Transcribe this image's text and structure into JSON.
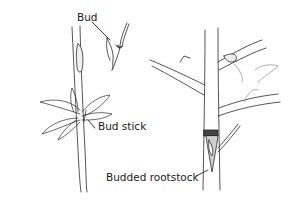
{
  "diagram": {
    "labels": {
      "bud": "Bud",
      "bud_stick": "Bud stick",
      "budded_rootstock": "Budded rootstock"
    },
    "colors": {
      "line": "#2a2a2a",
      "shade": "#555555",
      "light": "#9a9a9a",
      "background": "#ffffff"
    }
  }
}
